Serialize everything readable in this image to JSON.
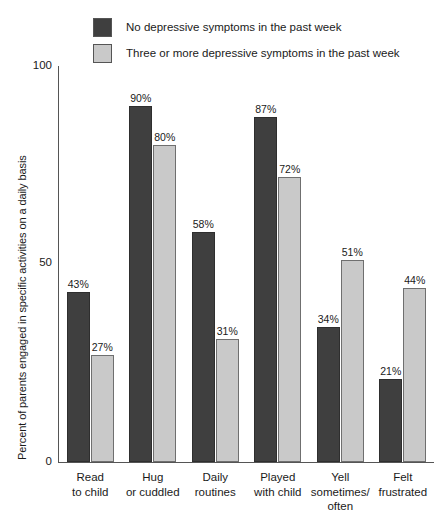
{
  "chart_data": {
    "type": "bar",
    "title": "",
    "xlabel": "",
    "ylabel": "Percent of parents engaged in specific activities on a daily basis",
    "ylim": [
      0,
      100
    ],
    "yticks": [
      "0",
      "50",
      "100"
    ],
    "grid": false,
    "legend_position": "top",
    "categories": [
      "Read to child",
      "Hug or cuddled",
      "Daily routines",
      "Played with child",
      "Yell sometimes/ often",
      "Felt frustrated"
    ],
    "category_lines": [
      [
        "Read",
        "to child"
      ],
      [
        "Hug",
        "or cuddled"
      ],
      [
        "Daily",
        "routines"
      ],
      [
        "Played",
        "with child"
      ],
      [
        "Yell",
        "sometimes/",
        "often"
      ],
      [
        "Felt",
        "frustrated"
      ]
    ],
    "series": [
      {
        "name": "No depressive symptoms in the past week",
        "color": "#3f3f3f",
        "values": [
          43,
          90,
          58,
          87,
          34,
          21
        ],
        "labels": [
          "43%",
          "90%",
          "58%",
          "87%",
          "34%",
          "21%"
        ]
      },
      {
        "name": "Three or more depressive symptoms in the past week",
        "color": "#c9c9c9",
        "values": [
          27,
          80,
          31,
          72,
          51,
          44
        ],
        "labels": [
          "27%",
          "80%",
          "31%",
          "72%",
          "51%",
          "44%"
        ]
      }
    ]
  },
  "legend": {
    "items": [
      {
        "label": "No depressive symptoms in the past week",
        "color": "#3f3f3f"
      },
      {
        "label": "Three or more depressive symptoms in the past week",
        "color": "#c9c9c9"
      }
    ]
  },
  "axis": {
    "y_title": "Percent of parents engaged in specific activities on a daily basis",
    "y_tick_100": "100",
    "y_tick_50": "50",
    "y_tick_0": "0"
  }
}
